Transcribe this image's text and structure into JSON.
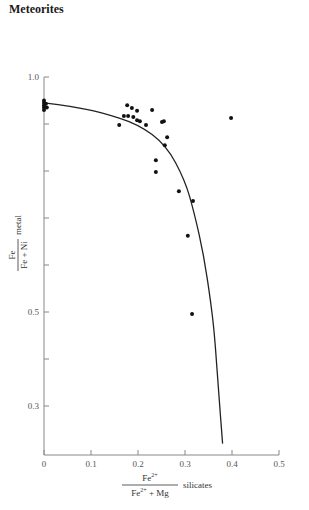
{
  "header": {
    "title": "Meteorites"
  },
  "chart_data": {
    "type": "scatter",
    "title": "",
    "xlabel": "Fe2+ / (Fe2+ + Mg) silicates",
    "ylabel": "Fe / (Fe + Ni) metal",
    "xlabel_parts": {
      "numerator": "Fe",
      "numerator_sup": "2+",
      "denominator": "Fe",
      "denominator_sup": "2+",
      "denominator_rest": " + Mg",
      "suffix": "silicates"
    },
    "ylabel_parts": {
      "numerator": "Fe",
      "denominator": "Fe + Ni",
      "suffix": "metal"
    },
    "xlim": [
      0,
      0.5
    ],
    "ylim": [
      0.22,
      1.0
    ],
    "x_ticks": [
      "0",
      "0.1",
      "0.2",
      "0.3",
      "0.4",
      "0.5"
    ],
    "y_ticks_labeled": [
      "1.0",
      "0.5",
      "0.3"
    ],
    "y_ticks_all": [
      1.0,
      0.9,
      0.8,
      0.7,
      0.6,
      0.5,
      0.4,
      0.3
    ],
    "grid": false,
    "legend": null,
    "points": [
      [
        0.0,
        0.95
      ],
      [
        0.0,
        0.945
      ],
      [
        0.0,
        0.94
      ],
      [
        0.0,
        0.935
      ],
      [
        0.0,
        0.93
      ],
      [
        0.004,
        0.943
      ],
      [
        0.006,
        0.935
      ],
      [
        0.177,
        0.94
      ],
      [
        0.187,
        0.934
      ],
      [
        0.198,
        0.928
      ],
      [
        0.23,
        0.93
      ],
      [
        0.17,
        0.917
      ],
      [
        0.179,
        0.917
      ],
      [
        0.19,
        0.915
      ],
      [
        0.198,
        0.908
      ],
      [
        0.204,
        0.906
      ],
      [
        0.16,
        0.898
      ],
      [
        0.217,
        0.898
      ],
      [
        0.251,
        0.904
      ],
      [
        0.255,
        0.906
      ],
      [
        0.262,
        0.872
      ],
      [
        0.257,
        0.855
      ],
      [
        0.238,
        0.823
      ],
      [
        0.238,
        0.798
      ],
      [
        0.287,
        0.757
      ],
      [
        0.317,
        0.736
      ],
      [
        0.306,
        0.662
      ],
      [
        0.315,
        0.496
      ],
      [
        0.398,
        0.913
      ]
    ],
    "curve": {
      "description": "fitted equilibrium curve",
      "points": [
        [
          0.0,
          0.945
        ],
        [
          0.06,
          0.937
        ],
        [
          0.12,
          0.925
        ],
        [
          0.2,
          0.9
        ],
        [
          0.26,
          0.855
        ],
        [
          0.3,
          0.78
        ],
        [
          0.32,
          0.71
        ],
        [
          0.34,
          0.62
        ],
        [
          0.355,
          0.52
        ],
        [
          0.363,
          0.45
        ],
        [
          0.37,
          0.35
        ],
        [
          0.38,
          0.22
        ]
      ]
    }
  }
}
